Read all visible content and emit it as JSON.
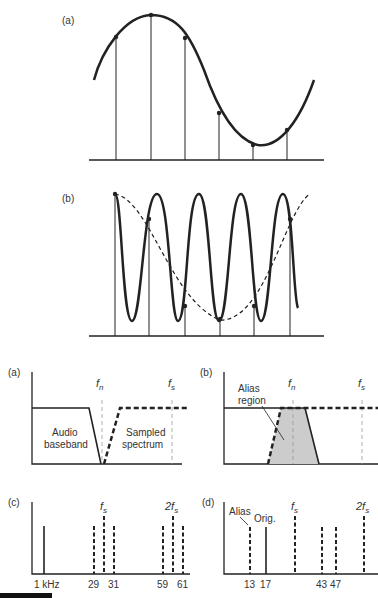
{
  "figure": {
    "panel_top_a": {
      "label": "(a)"
    },
    "panel_top_b": {
      "label": "(b)"
    },
    "panel_mid_a": {
      "label": "(a)",
      "fn": "f",
      "fn_sub": "n",
      "fs": "f",
      "fs_sub": "s",
      "text1a": "Audio",
      "text1b": "baseband",
      "text2a": "Sampled",
      "text2b": "spectrum"
    },
    "panel_mid_b": {
      "label": "(b)",
      "fn": "f",
      "fn_sub": "n",
      "fs": "f",
      "fs_sub": "s",
      "alias_a": "Alias",
      "alias_b": "region"
    },
    "panel_c": {
      "label": "(c)",
      "fs": "f",
      "fs_sub": "s",
      "two_fs": "2f",
      "two_fs_sub": "s",
      "ticks": [
        "1 kHz",
        "29",
        "31",
        "59",
        "61"
      ]
    },
    "panel_d": {
      "label": "(d)",
      "alias": "Alias",
      "orig": "Orig.",
      "fs": "f",
      "fs_sub": "s",
      "two_fs": "2f",
      "two_fs_sub": "s",
      "ticks": [
        "13",
        "17",
        "43",
        "47"
      ]
    }
  },
  "colors": {
    "ink": "#222222",
    "shade": "#cccccc",
    "guide": "#999999"
  }
}
